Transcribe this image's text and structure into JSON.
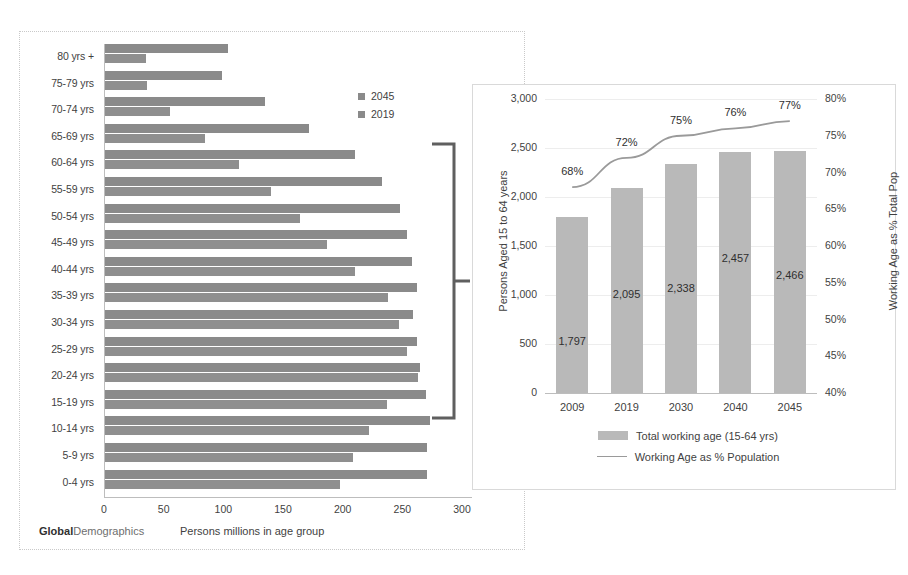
{
  "left_chart": {
    "brand_bold": "Global",
    "brand_rest": "Demographics",
    "x_axis_title": "Persons millions in age group",
    "legend": [
      {
        "label": "2045",
        "color": "#8a8a8a"
      },
      {
        "label": "2019",
        "color": "#8f8f8f"
      }
    ],
    "x_ticks": [
      "0",
      "50",
      "100",
      "150",
      "200",
      "250",
      "300"
    ]
  },
  "chart_data": [
    {
      "type": "bar",
      "orientation": "horizontal",
      "title": "",
      "xlabel": "Persons millions in age group",
      "ylabel": "",
      "xlim": [
        0,
        300
      ],
      "grid": false,
      "legend_position": "top-right",
      "categories": [
        "80 yrs +",
        "75-79 yrs",
        "70-74 yrs",
        "65-69 yrs",
        "60-64 yrs",
        "55-59 yrs",
        "50-54 yrs",
        "45-49 yrs",
        "40-44 yrs",
        "35-39 yrs",
        "30-34 yrs",
        "25-29 yrs",
        "20-24 yrs",
        "15-19 yrs",
        "10-14 yrs",
        "5-9 yrs",
        "0-4 yrs"
      ],
      "series": [
        {
          "name": "2045",
          "color": "#8a8a8a",
          "values": [
            104,
            99,
            135,
            172,
            210,
            233,
            248,
            254,
            258,
            262,
            259,
            262,
            265,
            270,
            273,
            271,
            271
          ]
        },
        {
          "name": "2019",
          "color": "#8f8f8f",
          "values": [
            35,
            36,
            55,
            85,
            113,
            140,
            164,
            187,
            210,
            238,
            247,
            254,
            263,
            237,
            222,
            209,
            198
          ]
        }
      ]
    },
    {
      "type": "bar",
      "title": "",
      "xlabel": "",
      "ylabel": "Persons Aged 15 to 64 years",
      "y2label": "Working Age as % Total Pop",
      "ylim": [
        0,
        3000
      ],
      "y2lim": [
        40,
        80
      ],
      "grid": true,
      "legend_position": "bottom",
      "categories": [
        "2009",
        "2019",
        "2030",
        "2040",
        "2045"
      ],
      "series": [
        {
          "name": "Total working age (15-64 yrs)",
          "type": "bar",
          "color": "#b9b9b9",
          "values": [
            1797,
            2095,
            2338,
            2457,
            2466
          ],
          "labels": [
            "1,797",
            "2,095",
            "2,338",
            "2,457",
            "2,466"
          ]
        },
        {
          "name": "Working Age as % Population",
          "type": "line",
          "color": "#9a9a9a",
          "axis": "y2",
          "values": [
            68,
            72,
            75,
            76,
            77
          ],
          "labels": [
            "68%",
            "72%",
            "75%",
            "76%",
            "77%"
          ]
        }
      ],
      "y_ticks": [
        "3,000",
        "2,500",
        "2,000",
        "1,500",
        "1,000",
        "500",
        "0"
      ],
      "y2_ticks": [
        "80%",
        "75%",
        "70%",
        "65%",
        "60%",
        "55%",
        "50%",
        "45%",
        "40%"
      ]
    }
  ],
  "right_chart": {
    "ylabel_left": "Persons Aged 15 to 64 years",
    "ylabel_right": "Working Age as % Total Pop",
    "legend": [
      {
        "label": "Total working age (15-64 yrs)",
        "marker": "bar"
      },
      {
        "label": "Working Age as % Population",
        "marker": "line"
      }
    ]
  }
}
